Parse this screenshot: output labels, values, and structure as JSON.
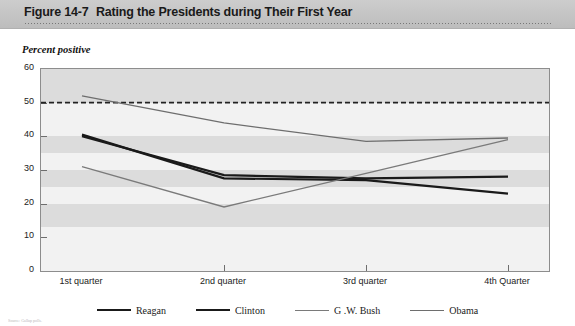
{
  "header": {
    "figure_label": "Figure 14-7",
    "title": "Rating the Presidents during Their First Year"
  },
  "axis_caption": "Percent positive",
  "source_note": "Source: Gallup polls.",
  "chart_data": {
    "type": "line",
    "title": "Rating the Presidents during Their First Year",
    "xlabel": "",
    "ylabel": "Percent positive",
    "ylim": [
      0,
      60
    ],
    "yticks": [
      0,
      10,
      20,
      30,
      40,
      50,
      60
    ],
    "grid": "horizontal-bands",
    "legend_position": "bottom",
    "categories": [
      "1st quarter",
      "2nd quarter",
      "3rd quarter",
      "4th Quarter"
    ],
    "series": [
      {
        "name": "Reagan",
        "color": "#1a1a1a",
        "width": 2.2,
        "values": [
          40.5,
          27.5,
          27.0,
          23.0
        ]
      },
      {
        "name": "Clinton",
        "color": "#1a1a1a",
        "width": 2.2,
        "values": [
          40.0,
          28.5,
          27.5,
          28.0
        ]
      },
      {
        "name": "G .W. Bush",
        "color": "#7a7a7a",
        "width": 1.3,
        "values": [
          31.0,
          19.0,
          29.0,
          39.0
        ]
      },
      {
        "name": "Obama",
        "color": "#6e6e6e",
        "width": 1.3,
        "values": [
          52.0,
          44.0,
          38.5,
          39.5
        ]
      }
    ],
    "annotations": [
      {
        "type": "reference-line",
        "orientation": "horizontal",
        "value": 50,
        "style": "dashed",
        "color": "#222222"
      }
    ]
  },
  "ytick_labels": [
    "60",
    "50",
    "40",
    "30",
    "20",
    "10",
    "0"
  ],
  "legend": [
    {
      "label": "Reagan",
      "color": "#1a1a1a",
      "thickness": "2.4px"
    },
    {
      "label": "Clinton",
      "color": "#1a1a1a",
      "thickness": "2.4px"
    },
    {
      "label": "G .W. Bush",
      "color": "#7a7a7a",
      "thickness": "1.4px"
    },
    {
      "label": "Obama",
      "color": "#6e6e6e",
      "thickness": "1.6px"
    }
  ]
}
